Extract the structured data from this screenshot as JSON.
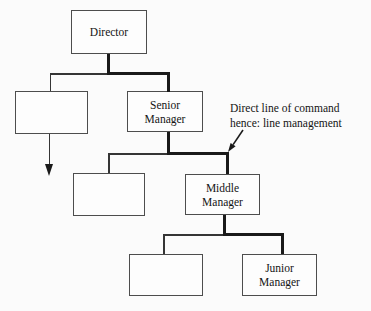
{
  "figure": {
    "type": "organization-chart",
    "nodes": {
      "director": {
        "label": "Director"
      },
      "unlabeled_top": {
        "label": ""
      },
      "senior_manager": {
        "label": "Senior\nManager"
      },
      "unlabeled_middle": {
        "label": ""
      },
      "middle_manager": {
        "label": "Middle\nManager"
      },
      "unlabeled_bottom": {
        "label": ""
      },
      "junior_manager": {
        "label": "Junior\nManager"
      }
    },
    "edges": [
      {
        "from": "director",
        "to": "unlabeled_top",
        "style": "thin"
      },
      {
        "from": "director",
        "to": "senior_manager",
        "style": "thick-line-of-command"
      },
      {
        "from": "unlabeled_top",
        "to": "continuation-arrow",
        "style": "thin-arrow-down"
      },
      {
        "from": "senior_manager",
        "to": "unlabeled_middle",
        "style": "thin"
      },
      {
        "from": "senior_manager",
        "to": "middle_manager",
        "style": "thick-line-of-command"
      },
      {
        "from": "middle_manager",
        "to": "unlabeled_bottom",
        "style": "thin"
      },
      {
        "from": "middle_manager",
        "to": "junior_manager",
        "style": "thick-line-of-command"
      }
    ],
    "annotation": {
      "text": "Direct line of command\nhence: line management"
    },
    "colors": {
      "background": "#fbfbfb",
      "box_border": "#4d4d4d",
      "thin_line": "#353535",
      "thick_line": "#1a1a1a",
      "text": "#141414"
    }
  }
}
